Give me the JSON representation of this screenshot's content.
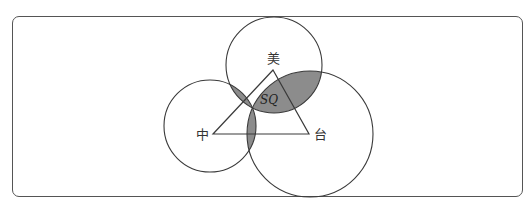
{
  "diagram": {
    "labels": {
      "top": "美",
      "left": "中",
      "right": "台",
      "center": "SQ"
    },
    "circles": [
      {
        "name": "美",
        "cx": 274,
        "cy": 65,
        "r": 48
      },
      {
        "name": "中",
        "cx": 210,
        "cy": 126,
        "r": 46
      },
      {
        "name": "台",
        "cx": 310,
        "cy": 134,
        "r": 63
      }
    ],
    "triangle": {
      "apex": [
        273,
        70
      ],
      "left": [
        213,
        134
      ],
      "right": [
        309,
        134
      ]
    },
    "colors": {
      "stroke": "#3a3a3a",
      "shade": "#8c8c8c",
      "frame": "#555555"
    }
  }
}
